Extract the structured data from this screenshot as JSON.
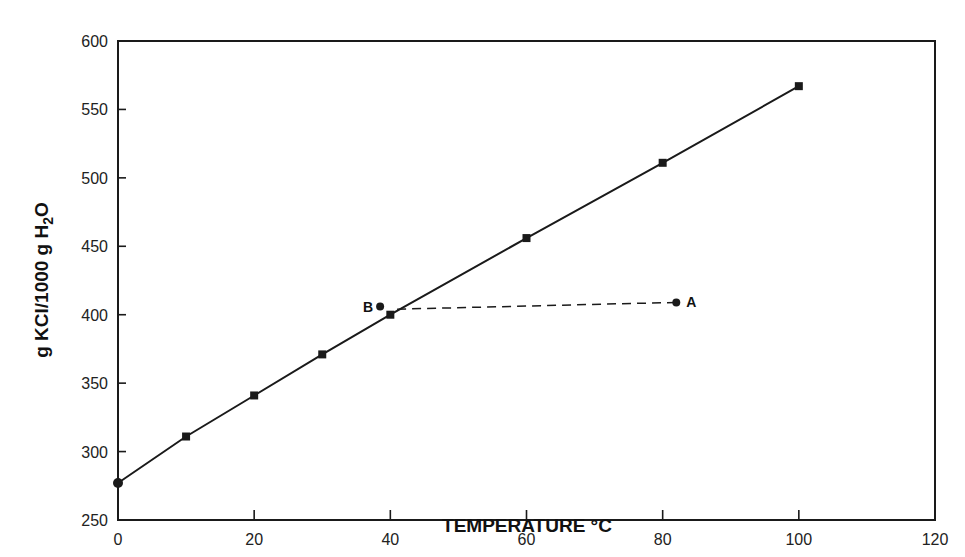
{
  "chart_data": {
    "type": "line",
    "title": "",
    "xlabel": "TEMPERATURE °C",
    "ylabel_parts": {
      "pre": "g KCl/1000 g H",
      "sub": "2",
      "post": "O"
    },
    "ylabel": "g KCl/1000 g H2O",
    "xlim": [
      0,
      120
    ],
    "ylim": [
      250,
      600
    ],
    "xticks": [
      0,
      20,
      40,
      60,
      80,
      100,
      120
    ],
    "xticks_minor": [
      10,
      30,
      50,
      70,
      90,
      110
    ],
    "yticks": [
      250,
      300,
      350,
      400,
      450,
      500,
      550,
      600
    ],
    "grid": false,
    "legend": null,
    "series": [
      {
        "name": "KCl solubility",
        "style": "solid",
        "marker": "square",
        "x": [
          0,
          10,
          20,
          30,
          40,
          60,
          80,
          100
        ],
        "y": [
          277,
          311,
          341,
          371,
          400,
          456,
          511,
          567
        ]
      },
      {
        "name": "A to B",
        "style": "dashed",
        "marker": "none",
        "x": [
          41,
          82
        ],
        "y": [
          404,
          409
        ]
      }
    ],
    "annotations": [
      {
        "label": "A",
        "x": 82,
        "y": 409,
        "marker": "dot"
      },
      {
        "label": "B",
        "x": 38.5,
        "y": 406,
        "marker": "dot"
      }
    ]
  }
}
